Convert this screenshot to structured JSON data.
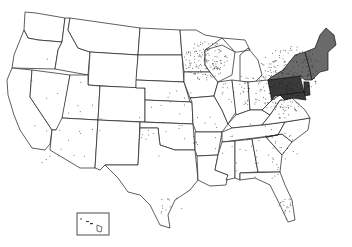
{
  "map": {
    "title": "",
    "region": "United States",
    "type": "dot-density",
    "dot_color": "#1a1a1a",
    "shading": {
      "dense_color": "#3a3a3a",
      "medium_color": "#6a6a6a"
    },
    "inset": {
      "label": "Hawaii"
    },
    "clusters": [
      {
        "name": "northeast",
        "cx": 290,
        "cy": 70,
        "rx": 30,
        "ry": 25,
        "n": 160
      },
      {
        "name": "upper-midwest",
        "cx": 205,
        "cy": 60,
        "rx": 22,
        "ry": 20,
        "n": 150
      },
      {
        "name": "mid-atlantic",
        "cx": 282,
        "cy": 100,
        "rx": 18,
        "ry": 18,
        "n": 90
      },
      {
        "name": "great-lakes",
        "cx": 245,
        "cy": 90,
        "rx": 25,
        "ry": 15,
        "n": 50
      },
      {
        "name": "southeast",
        "cx": 260,
        "cy": 150,
        "rx": 40,
        "ry": 30,
        "n": 50
      },
      {
        "name": "central",
        "cx": 180,
        "cy": 130,
        "rx": 45,
        "ry": 40,
        "n": 40
      },
      {
        "name": "west",
        "cx": 60,
        "cy": 110,
        "rx": 45,
        "ry": 60,
        "n": 25
      },
      {
        "name": "florida",
        "cx": 283,
        "cy": 205,
        "rx": 8,
        "ry": 15,
        "n": 20
      },
      {
        "name": "texas-coast",
        "cx": 170,
        "cy": 205,
        "rx": 15,
        "ry": 10,
        "n": 12
      }
    ]
  }
}
